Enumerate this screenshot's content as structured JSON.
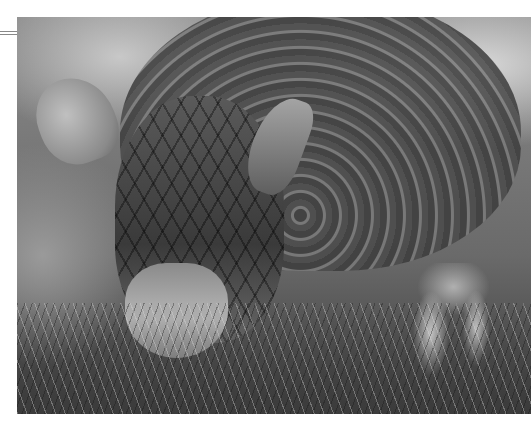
{
  "image": {
    "subject": "armadillo",
    "description": "Black-and-white close-up photograph of an armadillo foraging in grass, showing its banded shell, scaled head, ears and front claws",
    "color_mode": "grayscale"
  }
}
